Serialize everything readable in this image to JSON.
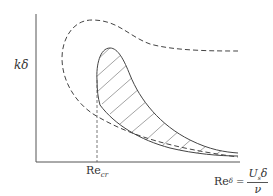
{
  "diagram": {
    "type": "stability-diagram",
    "y_axis": {
      "label": "kδ"
    },
    "x_axis": {
      "label_main": "Re",
      "label_sub": "δ",
      "equals": "=",
      "numerator": "U",
      "numerator_sub": "s",
      "numerator_tail": "δ",
      "denominator": "ν"
    },
    "critical_marker": {
      "label_main": "Re",
      "label_sub": "cr"
    },
    "curves": [
      {
        "name": "outer-neutral-curve",
        "style": "dashed"
      },
      {
        "name": "inner-unstable-region",
        "style": "solid-hatched"
      }
    ],
    "colors": {
      "line": "#444444",
      "background": "#ffffff"
    }
  }
}
